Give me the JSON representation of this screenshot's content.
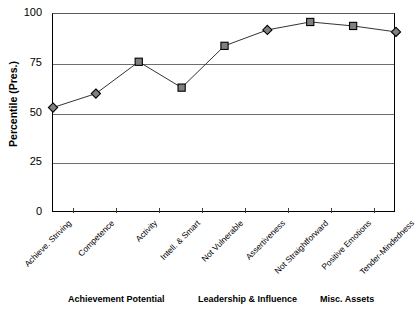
{
  "chart_data": {
    "type": "line",
    "title": "",
    "xlabel": "",
    "ylabel": "Percentile (Pres.)",
    "ylim": [
      0,
      100
    ],
    "yticks": [
      0,
      25,
      50,
      75,
      100
    ],
    "ytick_labels": [
      "0",
      "25",
      "50",
      "75",
      "100"
    ],
    "grid": true,
    "legend": "none",
    "categories": [
      "Achieve. Striving",
      "Competence",
      "Activity",
      "Intell. & Smart",
      "Not Vulnerable",
      "Assertiveness",
      "Not Straightforward",
      "Positive Emotions",
      "Tender-Mindedness"
    ],
    "values": [
      53,
      60,
      76,
      63,
      84,
      92,
      96,
      94,
      91
    ],
    "marker_shapes": [
      "diamond",
      "diamond",
      "square",
      "square",
      "square",
      "diamond",
      "square",
      "square",
      "diamond"
    ],
    "marker_fill": "#808080",
    "marker_edge": "#000000",
    "line_color": "#333333",
    "groups": [
      {
        "label": "Achievement Potential",
        "left_px": 68
      },
      {
        "label": "Leadership & Influence",
        "left_px": 198
      },
      {
        "label": "Misc. Assets",
        "left_px": 320
      }
    ]
  },
  "axis": {
    "y_title": "Percentile (Pres.)"
  }
}
